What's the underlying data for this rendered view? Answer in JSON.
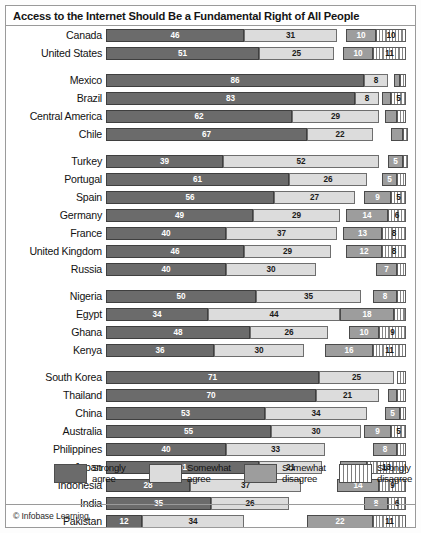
{
  "title": "Access to the Internet Should Be a Fundamental Right of All People",
  "credit": "© Infobase Learning",
  "legend": {
    "items": [
      {
        "label": "Strongly\nagree",
        "key": "strongly_agree",
        "color": "#6b6b6b",
        "icon": "swatch-strongly-agree"
      },
      {
        "label": "Somewhat\nagree",
        "key": "somewhat_agree",
        "color": "#dcdcdc",
        "icon": "swatch-somewhat-agree"
      },
      {
        "label": "Somewhat\ndisagree",
        "key": "somewhat_disagree",
        "color": "#9d9d9d",
        "icon": "swatch-somewhat-disagree"
      },
      {
        "label": "Strongly\ndisagree",
        "key": "strongly_disagree",
        "color": "#ffffff",
        "icon": "swatch-strongly-disagree"
      }
    ]
  },
  "chart_data": {
    "type": "bar",
    "subtype": "diverging-stacked-bar",
    "title": "Access to the Internet Should Be a Fundamental Right of All People",
    "xlabel": "",
    "ylabel": "",
    "xlim": [
      0,
      100
    ],
    "grid": false,
    "legend_position": "bottom",
    "series": [
      {
        "name": "Strongly agree",
        "color": "#6b6b6b",
        "align": "left"
      },
      {
        "name": "Somewhat agree",
        "color": "#dcdcdc",
        "align": "left"
      },
      {
        "name": "Somewhat disagree",
        "color": "#9d9d9d",
        "align": "right"
      },
      {
        "name": "Strongly disagree",
        "color": "#ffffff",
        "align": "right"
      }
    ],
    "groups": [
      {
        "name": "North America",
        "rows": [
          {
            "label": "Canada",
            "strongly_agree": 46,
            "somewhat_agree": 31,
            "somewhat_disagree": 10,
            "strongly_disagree": 10
          },
          {
            "label": "United States",
            "strongly_agree": 51,
            "somewhat_agree": 25,
            "somewhat_disagree": 10,
            "strongly_disagree": 11
          }
        ]
      },
      {
        "name": "Latin America",
        "rows": [
          {
            "label": "Mexico",
            "strongly_agree": 86,
            "somewhat_agree": 8,
            "somewhat_disagree": 2,
            "strongly_disagree": 2
          },
          {
            "label": "Brazil",
            "strongly_agree": 83,
            "somewhat_agree": 8,
            "somewhat_disagree": 3,
            "strongly_disagree": 5
          },
          {
            "label": "Central America",
            "strongly_agree": 62,
            "somewhat_agree": 29,
            "somewhat_disagree": 4,
            "strongly_disagree": 3
          },
          {
            "label": "Chile",
            "strongly_agree": 67,
            "somewhat_agree": 22,
            "somewhat_disagree": 4,
            "strongly_disagree": 1
          }
        ]
      },
      {
        "name": "Europe and Turkey",
        "rows": [
          {
            "label": "Turkey",
            "strongly_agree": 39,
            "somewhat_agree": 52,
            "somewhat_disagree": 5,
            "strongly_disagree": 1
          },
          {
            "label": "Portugal",
            "strongly_agree": 61,
            "somewhat_agree": 26,
            "somewhat_disagree": 5,
            "strongly_disagree": 3
          },
          {
            "label": "Spain",
            "strongly_agree": 56,
            "somewhat_agree": 27,
            "somewhat_disagree": 9,
            "strongly_disagree": 5
          },
          {
            "label": "Germany",
            "strongly_agree": 49,
            "somewhat_agree": 29,
            "somewhat_disagree": 14,
            "strongly_disagree": 6
          },
          {
            "label": "France",
            "strongly_agree": 40,
            "somewhat_agree": 37,
            "somewhat_disagree": 13,
            "strongly_disagree": 8
          },
          {
            "label": "United Kingdom",
            "strongly_agree": 46,
            "somewhat_agree": 29,
            "somewhat_disagree": 12,
            "strongly_disagree": 8
          },
          {
            "label": "Russia",
            "strongly_agree": 40,
            "somewhat_agree": 30,
            "somewhat_disagree": 7,
            "strongly_disagree": 3
          }
        ]
      },
      {
        "name": "Africa",
        "rows": [
          {
            "label": "Nigeria",
            "strongly_agree": 50,
            "somewhat_agree": 35,
            "somewhat_disagree": 8,
            "strongly_disagree": 3
          },
          {
            "label": "Egypt",
            "strongly_agree": 34,
            "somewhat_agree": 44,
            "somewhat_disagree": 18,
            "strongly_disagree": 4
          },
          {
            "label": "Ghana",
            "strongly_agree": 48,
            "somewhat_agree": 26,
            "somewhat_disagree": 10,
            "strongly_disagree": 9
          },
          {
            "label": "Kenya",
            "strongly_agree": 36,
            "somewhat_agree": 30,
            "somewhat_disagree": 16,
            "strongly_disagree": 11
          }
        ]
      },
      {
        "name": "Asia-Pacific",
        "rows": [
          {
            "label": "South Korea",
            "strongly_agree": 71,
            "somewhat_agree": 25,
            "somewhat_disagree": 0,
            "strongly_disagree": 3
          },
          {
            "label": "Thailand",
            "strongly_agree": 70,
            "somewhat_agree": 21,
            "somewhat_disagree": 3,
            "strongly_disagree": 3
          },
          {
            "label": "China",
            "strongly_agree": 53,
            "somewhat_agree": 34,
            "somewhat_disagree": 5,
            "strongly_disagree": 2
          },
          {
            "label": "Australia",
            "strongly_agree": 55,
            "somewhat_agree": 30,
            "somewhat_disagree": 9,
            "strongly_disagree": 5
          },
          {
            "label": "Philippines",
            "strongly_agree": 40,
            "somewhat_agree": 33,
            "somewhat_disagree": 8,
            "strongly_disagree": 3
          },
          {
            "label": "Japan",
            "strongly_agree": 51,
            "somewhat_agree": 21,
            "somewhat_disagree": 9,
            "strongly_disagree": 13
          },
          {
            "label": "Indonesia",
            "strongly_agree": 28,
            "somewhat_agree": 37,
            "somewhat_disagree": 14,
            "strongly_disagree": 9
          },
          {
            "label": "India",
            "strongly_agree": 35,
            "somewhat_agree": 26,
            "somewhat_disagree": 8,
            "strongly_disagree": 6
          },
          {
            "label": "Pakistan",
            "strongly_agree": 12,
            "somewhat_agree": 34,
            "somewhat_disagree": 22,
            "strongly_disagree": 11
          }
        ]
      }
    ]
  }
}
